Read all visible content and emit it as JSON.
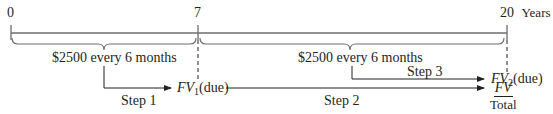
{
  "timeline": {
    "ticks": [
      {
        "label": "0",
        "position": 0
      },
      {
        "label": "7",
        "position": 7
      },
      {
        "label": "20",
        "position": 20
      }
    ],
    "unit": "Years"
  },
  "segments": [
    {
      "range": "0-7",
      "label": "$2500 every 6 months"
    },
    {
      "range": "7-20",
      "label": "$2500 every 6 months"
    }
  ],
  "steps": [
    {
      "label": "Step 1",
      "target_main": "FV",
      "target_sub": "1",
      "target_suffix": "(due)"
    },
    {
      "label": "Step 2",
      "target_main": "FV",
      "target_den": "Total"
    },
    {
      "label": "Step 3",
      "target_main": "FV",
      "target_sub": "2",
      "target_suffix": "(due)"
    }
  ],
  "colors": {
    "line": "#231f20",
    "background": "#ffffff"
  }
}
